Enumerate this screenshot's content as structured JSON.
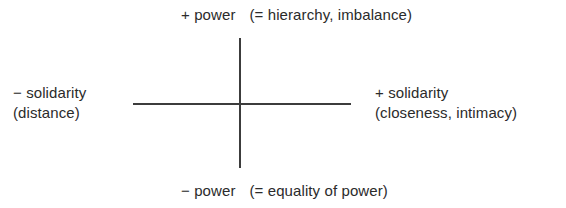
{
  "diagram": {
    "type": "axis-cross",
    "colors": {
      "background": "#ffffff",
      "axis_line": "#3c3c3c",
      "text": "#2b2b2b"
    },
    "axes": {
      "vertical": {
        "name": "power-axis",
        "positive_end": "top",
        "negative_end": "bottom"
      },
      "horizontal": {
        "name": "solidarity-axis",
        "positive_end": "right",
        "negative_end": "left"
      }
    },
    "labels": {
      "top": {
        "term": "+ power",
        "gloss": "(= hierarchy, imbalance)"
      },
      "bottom": {
        "term": "− power",
        "gloss": "(= equality of power)"
      },
      "left": {
        "term": "− solidarity",
        "gloss": "(distance)"
      },
      "right": {
        "term": "+ solidarity",
        "gloss": "(closeness, intimacy)"
      }
    }
  }
}
